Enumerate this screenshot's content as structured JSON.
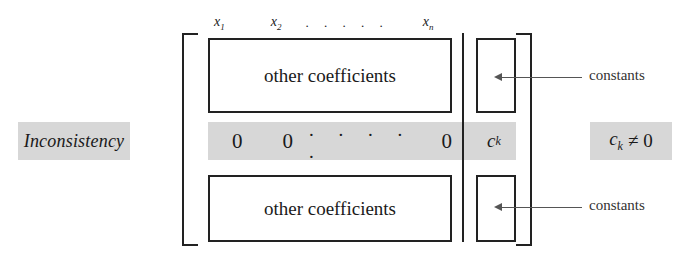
{
  "figure": {
    "side_label": "Inconsistency",
    "matrix": {
      "column_headers": {
        "first": "x",
        "first_sub": "1",
        "second": "x",
        "second_sub": "2",
        "dots": ". . . . .",
        "last": "x",
        "last_sub": "n"
      },
      "top_block_label": "other coefficients",
      "bottom_block_label": "other coefficients",
      "zero_row": {
        "first": "0",
        "second": "0",
        "dots": ". . . . .",
        "last": "0"
      },
      "pivot_constant": {
        "symbol": "c",
        "subscript": "k"
      }
    },
    "condition": {
      "symbol": "c",
      "subscript": "k",
      "relation": "≠",
      "value": "0"
    },
    "annotations": {
      "constants_top": "constants",
      "constants_bottom": "constants"
    },
    "colors": {
      "highlight_band": "#d7d7d7",
      "ink": "#1a1a1a",
      "leader_line": "#555555",
      "page_background": "#ffffff"
    }
  }
}
